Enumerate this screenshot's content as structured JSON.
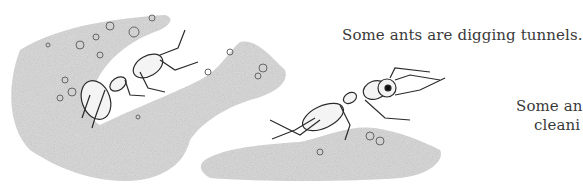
{
  "page": {
    "captions": [
      {
        "text": "Some ants are digging tunnels."
      },
      {
        "text_line1": "Some an",
        "text_line2": "cleani"
      }
    ]
  },
  "illustration": {
    "subject": "ants digging tunnels in soil",
    "elements": [
      "ant-left-tunnel",
      "ant-right-carrying",
      "soil-mound-left",
      "soil-mound-right",
      "pebbles"
    ]
  },
  "colors": {
    "soil": "#c9c9c9",
    "soil_dark": "#a8a8a8",
    "ink": "#333333",
    "text": "#3a3a3a",
    "background": "#ffffff"
  }
}
